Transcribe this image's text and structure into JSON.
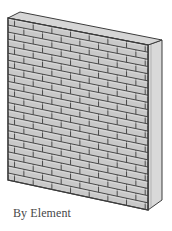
{
  "figure": {
    "caption": "By Element",
    "colors": {
      "brick_fill": "#c9c9c9",
      "mortar_line": "#4a4a4a",
      "top_face": "#d6d6d6",
      "side_face": "#d9d9d9",
      "outline": "#3c3c3c",
      "caption_text": "#474747"
    },
    "geometry": {
      "front_top_left": [
        8,
        18
      ],
      "front_top_right": [
        148,
        45
      ],
      "front_bottom_left": [
        8,
        180
      ],
      "front_bottom_right": [
        148,
        210
      ],
      "back_top_left": [
        20,
        12
      ],
      "back_top_right": [
        162,
        40
      ],
      "back_bottom_right": [
        162,
        200
      ],
      "courses": 23,
      "bricks_per_course": 7.5
    }
  }
}
